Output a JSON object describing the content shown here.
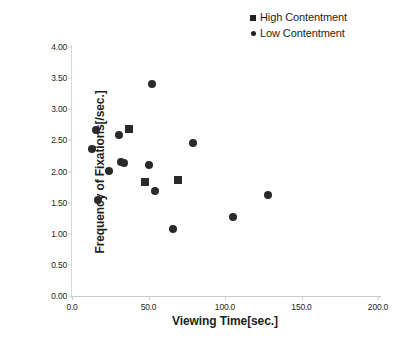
{
  "chart_data": {
    "type": "scatter",
    "title": "",
    "xlabel": "Viewing Time[sec.]",
    "ylabel": "Frequency of Fixations[/sec.]",
    "xlim": [
      0.0,
      200.0
    ],
    "ylim": [
      0.0,
      4.0
    ],
    "xticks": [
      "0.0",
      "50.0",
      "100.0",
      "150.0",
      "200.0"
    ],
    "xtick_values": [
      0,
      50,
      100,
      150,
      200
    ],
    "yticks": [
      "0.00",
      "0.50",
      "1.00",
      "1.50",
      "2.00",
      "2.50",
      "3.00",
      "3.50",
      "4.00"
    ],
    "ytick_values": [
      0,
      0.5,
      1.0,
      1.5,
      2.0,
      2.5,
      3.0,
      3.5,
      4.0
    ],
    "grid": false,
    "legend_position": "top-right",
    "marker_color": "#2a2a2a",
    "series": [
      {
        "name": "High Contentment",
        "marker": "square",
        "points": [
          {
            "x": 37,
            "y": 2.69
          },
          {
            "x": 48,
            "y": 1.83
          },
          {
            "x": 69,
            "y": 1.87
          }
        ]
      },
      {
        "name": "Low Contentment",
        "marker": "circle",
        "points": [
          {
            "x": 13,
            "y": 2.36
          },
          {
            "x": 16,
            "y": 2.67
          },
          {
            "x": 17,
            "y": 1.55
          },
          {
            "x": 24,
            "y": 2.01
          },
          {
            "x": 31,
            "y": 2.58
          },
          {
            "x": 32,
            "y": 2.15
          },
          {
            "x": 34,
            "y": 2.14
          },
          {
            "x": 52,
            "y": 3.4
          },
          {
            "x": 50,
            "y": 2.1
          },
          {
            "x": 54,
            "y": 1.69
          },
          {
            "x": 66,
            "y": 1.07
          },
          {
            "x": 79,
            "y": 2.46
          },
          {
            "x": 105,
            "y": 1.27
          },
          {
            "x": 128,
            "y": 1.62
          }
        ]
      }
    ]
  },
  "legend": {
    "entries": [
      {
        "label": "High Contentment",
        "marker": "square"
      },
      {
        "label": "Low Contentment",
        "marker": "circle"
      }
    ]
  }
}
